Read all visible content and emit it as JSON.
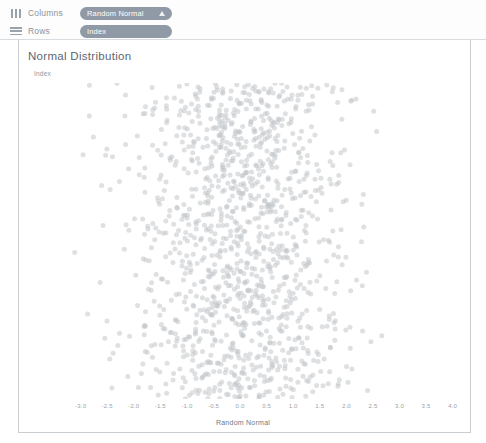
{
  "shelves": {
    "columns": {
      "label": "Columns",
      "icon": "columns-icon",
      "pill": {
        "text": "Random Normal",
        "icon": "triangle-up-icon"
      }
    },
    "rows": {
      "label": "Rows",
      "icon": "rows-icon",
      "pill": {
        "text": "Index"
      }
    }
  },
  "viz": {
    "title": "Normal Distribution",
    "row_field_label": "Index"
  },
  "colors": {
    "pill_bg": "#8f9aa6",
    "pill_text": "#ffffff",
    "point": "#c3c7cb",
    "axis_text": "#9aa2aa",
    "title_text": "#5e6670",
    "border": "#c9ced3"
  },
  "chart_data": {
    "type": "scatter",
    "title": "Normal Distribution",
    "xlabel": "Random Normal",
    "ylabel": "Index",
    "grid": false,
    "legend": false,
    "xlim": [
      -3.35,
      4.25
    ],
    "ylim": [
      0,
      1200
    ],
    "xticks": [
      -3.0,
      -2.5,
      -2.0,
      -1.5,
      -1.0,
      -0.5,
      0.0,
      0.5,
      1.0,
      1.5,
      2.0,
      2.5,
      3.0,
      3.5,
      4.0
    ],
    "xticklabels": [
      "-3.0",
      "-2.5",
      "-2.0",
      "-1.5",
      "-1.0",
      "-0.5",
      "0.0",
      "0.5",
      "1.0",
      "1.5",
      "2.0",
      "2.5",
      "3.0",
      "3.5",
      "4.0"
    ],
    "yticks": [],
    "yticklabels": [],
    "series": [
      {
        "name": "Random Normal",
        "marker": "circle",
        "marker_size": 5,
        "color": "#c3c7cb",
        "opacity": 0.55,
        "n_points": 1200,
        "distribution": {
          "x": "normal",
          "mean": 0.0,
          "std": 1.0,
          "y": "uniform-index"
        }
      }
    ]
  }
}
